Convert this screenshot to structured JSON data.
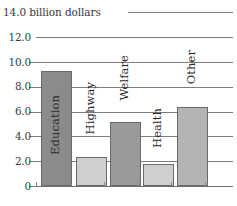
{
  "chart_data": {
    "type": "bar",
    "title": "14.0 billion dollars",
    "units_caption": "14.0 billion dollars",
    "xlabel": "",
    "ylabel": "billion dollars",
    "ylim": [
      0,
      14
    ],
    "grid": true,
    "legend": "none",
    "categories": [
      "Education",
      "Highway",
      "Welfare",
      "Health",
      "Other"
    ],
    "values": [
      9.3,
      2.3,
      5.2,
      1.8,
      6.4
    ],
    "ytick_labels": [
      "0",
      "2.0",
      "4.0",
      "6.0",
      "8.0",
      "10.0",
      "12.0",
      "14.0"
    ],
    "ytick_values": [
      0,
      2,
      4,
      6,
      8,
      10,
      12,
      14
    ],
    "bar_colors": [
      "#8b8b8b",
      "#cfcfcf",
      "#9a9a9a",
      "#cfcfcf",
      "#b4b4b4"
    ],
    "gridline_color": "#7d7d7d",
    "axis_color": "#6f6f6f",
    "text_color": "#3a3a3a"
  },
  "caption": {
    "top_label": "14.0 billion dollars"
  },
  "axis": {
    "ticks": [
      {
        "label": "14.0",
        "value": 14
      },
      {
        "label": "12.0",
        "value": 12
      },
      {
        "label": "10.0",
        "value": 10
      },
      {
        "label": "8.0",
        "value": 8
      },
      {
        "label": "6.0",
        "value": 6
      },
      {
        "label": "4.0",
        "value": 4
      },
      {
        "label": "2.0",
        "value": 2
      },
      {
        "label": "0",
        "value": 0
      }
    ]
  },
  "bars": [
    {
      "label": "Education",
      "value": 9.3
    },
    {
      "label": "Highway",
      "value": 2.3
    },
    {
      "label": "Welfare",
      "value": 5.2
    },
    {
      "label": "Health",
      "value": 1.8
    },
    {
      "label": "Other",
      "value": 6.4
    }
  ]
}
